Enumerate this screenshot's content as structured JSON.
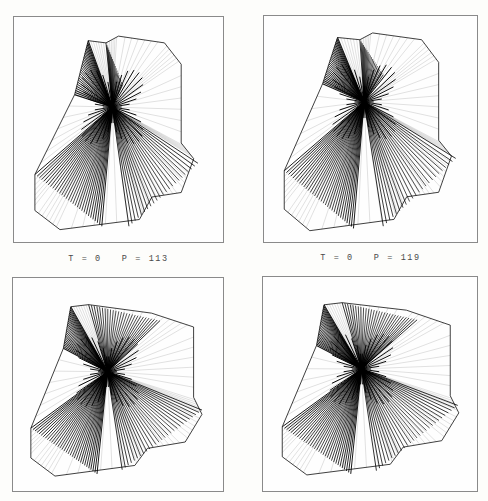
{
  "figure": {
    "background_color": "#fdfdfb",
    "ink_color": "#000000",
    "frame_color": "#8a8a8a",
    "plate_count": 4,
    "layout": "2x2-grid"
  },
  "captions": [
    {
      "id": "caption-top-left",
      "text": "T = 0   P = 113"
    },
    {
      "id": "caption-top-right",
      "text": "T = 0   P = 119"
    }
  ],
  "plates": [
    {
      "id": "plate-top-left",
      "name": "ruled-surface-plate-1",
      "caption": "T = 0   P = 113",
      "description": "twisted ruled wireframe surface, single pinch node"
    },
    {
      "id": "plate-top-right",
      "name": "ruled-surface-plate-2",
      "caption": "T = 0   P = 119",
      "description": "twisted ruled wireframe surface, single pinch node"
    },
    {
      "id": "plate-bottom-left",
      "name": "ruled-surface-plate-3",
      "caption": "",
      "description": "twisted ruled wireframe surface, broad pinch node"
    },
    {
      "id": "plate-bottom-right",
      "name": "ruled-surface-plate-4",
      "caption": "",
      "description": "twisted ruled wireframe surface, broad pinch node"
    }
  ],
  "chart_data": {
    "type": "line",
    "title": "",
    "xlabel": "",
    "ylabel": "",
    "legend": [],
    "grid": false,
    "panels": [
      {
        "name": "plate-top-left",
        "caption": "T = 0   P = 113",
        "parameters": {
          "T": 0,
          "P": 113
        },
        "node": [
          0.47,
          0.4
        ],
        "ruling_count": 96,
        "fans": [
          {
            "name": "upper-left-dense",
            "apex": [
              0.47,
              0.4
            ],
            "from": [
              0.355,
              0.105
            ],
            "to": [
              0.29,
              0.345
            ],
            "count": 26,
            "weight": 1.0
          },
          {
            "name": "upper-right-open",
            "apex": [
              0.47,
              0.4
            ],
            "from": [
              0.44,
              0.115
            ],
            "to": [
              0.52,
              0.3
            ],
            "count": 18,
            "weight": 0.55
          },
          {
            "name": "lower-left-sweep",
            "apex": [
              0.47,
              0.4
            ],
            "from": [
              0.1,
              0.7
            ],
            "to": [
              0.42,
              0.93
            ],
            "count": 30,
            "weight": 0.75
          },
          {
            "name": "lower-right-sweep",
            "apex": [
              0.47,
              0.4
            ],
            "from": [
              0.55,
              0.93
            ],
            "to": [
              0.88,
              0.65
            ],
            "count": 22,
            "weight": 0.6
          }
        ],
        "outline": [
          [
            0.355,
            0.105
          ],
          [
            0.44,
            0.115
          ],
          [
            0.5,
            0.085
          ],
          [
            0.72,
            0.115
          ],
          [
            0.8,
            0.21
          ],
          [
            0.8,
            0.56
          ],
          [
            0.86,
            0.63
          ],
          [
            0.8,
            0.78
          ],
          [
            0.66,
            0.8
          ],
          [
            0.6,
            0.9
          ],
          [
            0.22,
            0.945
          ],
          [
            0.1,
            0.86
          ],
          [
            0.1,
            0.7
          ],
          [
            0.29,
            0.345
          ]
        ]
      },
      {
        "name": "plate-top-right",
        "caption": "T = 0   P = 119",
        "parameters": {
          "T": 0,
          "P": 119
        },
        "node": [
          0.47,
          0.38
        ],
        "ruling_count": 100,
        "fans": [
          {
            "name": "upper-left-dense",
            "apex": [
              0.47,
              0.38
            ],
            "from": [
              0.345,
              0.095
            ],
            "to": [
              0.275,
              0.3
            ],
            "count": 28,
            "weight": 1.0
          },
          {
            "name": "upper-right-open",
            "apex": [
              0.47,
              0.38
            ],
            "from": [
              0.45,
              0.105
            ],
            "to": [
              0.56,
              0.26
            ],
            "count": 20,
            "weight": 0.55
          },
          {
            "name": "lower-left-sweep",
            "apex": [
              0.47,
              0.38
            ],
            "from": [
              0.095,
              0.685
            ],
            "to": [
              0.42,
              0.94
            ],
            "count": 32,
            "weight": 0.75
          },
          {
            "name": "lower-right-sweep",
            "apex": [
              0.47,
              0.38
            ],
            "from": [
              0.56,
              0.93
            ],
            "to": [
              0.9,
              0.63
            ],
            "count": 22,
            "weight": 0.6
          }
        ],
        "outline": [
          [
            0.345,
            0.095
          ],
          [
            0.45,
            0.105
          ],
          [
            0.51,
            0.075
          ],
          [
            0.74,
            0.105
          ],
          [
            0.82,
            0.205
          ],
          [
            0.82,
            0.55
          ],
          [
            0.88,
            0.62
          ],
          [
            0.82,
            0.78
          ],
          [
            0.67,
            0.8
          ],
          [
            0.61,
            0.9
          ],
          [
            0.215,
            0.95
          ],
          [
            0.095,
            0.855
          ],
          [
            0.095,
            0.685
          ],
          [
            0.275,
            0.3
          ]
        ]
      },
      {
        "name": "plate-bottom-left",
        "caption": "",
        "parameters": {
          "T": 0,
          "P": null
        },
        "node": [
          0.45,
          0.44
        ],
        "ruling_count": 110,
        "fans": [
          {
            "name": "upper-left-dense",
            "apex": [
              0.45,
              0.44
            ],
            "from": [
              0.275,
              0.135
            ],
            "to": [
              0.24,
              0.33
            ],
            "count": 26,
            "weight": 0.9
          },
          {
            "name": "upper-right-open",
            "apex": [
              0.45,
              0.44
            ],
            "from": [
              0.36,
              0.125
            ],
            "to": [
              0.7,
              0.2
            ],
            "count": 26,
            "weight": 0.6
          },
          {
            "name": "lower-left-sweep",
            "apex": [
              0.45,
              0.44
            ],
            "from": [
              0.085,
              0.705
            ],
            "to": [
              0.4,
              0.92
            ],
            "count": 32,
            "weight": 0.8
          },
          {
            "name": "lower-right-sweep",
            "apex": [
              0.45,
              0.44
            ],
            "from": [
              0.52,
              0.9
            ],
            "to": [
              0.9,
              0.62
            ],
            "count": 26,
            "weight": 0.6
          }
        ],
        "outline": [
          [
            0.275,
            0.135
          ],
          [
            0.36,
            0.125
          ],
          [
            0.66,
            0.165
          ],
          [
            0.86,
            0.23
          ],
          [
            0.86,
            0.56
          ],
          [
            0.9,
            0.64
          ],
          [
            0.82,
            0.77
          ],
          [
            0.64,
            0.8
          ],
          [
            0.58,
            0.88
          ],
          [
            0.2,
            0.93
          ],
          [
            0.085,
            0.845
          ],
          [
            0.085,
            0.705
          ],
          [
            0.24,
            0.33
          ]
        ]
      },
      {
        "name": "plate-bottom-right",
        "caption": "",
        "parameters": {
          "T": 0,
          "P": null
        },
        "node": [
          0.46,
          0.43
        ],
        "ruling_count": 112,
        "fans": [
          {
            "name": "upper-left-dense",
            "apex": [
              0.46,
              0.43
            ],
            "from": [
              0.285,
              0.13
            ],
            "to": [
              0.25,
              0.32
            ],
            "count": 28,
            "weight": 0.9
          },
          {
            "name": "upper-right-open",
            "apex": [
              0.46,
              0.43
            ],
            "from": [
              0.37,
              0.12
            ],
            "to": [
              0.72,
              0.2
            ],
            "count": 28,
            "weight": 0.6
          },
          {
            "name": "lower-left-sweep",
            "apex": [
              0.46,
              0.43
            ],
            "from": [
              0.09,
              0.7
            ],
            "to": [
              0.41,
              0.92
            ],
            "count": 32,
            "weight": 0.8
          },
          {
            "name": "lower-right-sweep",
            "apex": [
              0.46,
              0.43
            ],
            "from": [
              0.53,
              0.905
            ],
            "to": [
              0.91,
              0.6
            ],
            "count": 26,
            "weight": 0.6
          }
        ],
        "outline": [
          [
            0.285,
            0.13
          ],
          [
            0.37,
            0.12
          ],
          [
            0.67,
            0.155
          ],
          [
            0.875,
            0.225
          ],
          [
            0.875,
            0.555
          ],
          [
            0.915,
            0.635
          ],
          [
            0.835,
            0.765
          ],
          [
            0.655,
            0.795
          ],
          [
            0.595,
            0.875
          ],
          [
            0.205,
            0.925
          ],
          [
            0.09,
            0.84
          ],
          [
            0.09,
            0.7
          ],
          [
            0.25,
            0.32
          ]
        ]
      }
    ]
  }
}
